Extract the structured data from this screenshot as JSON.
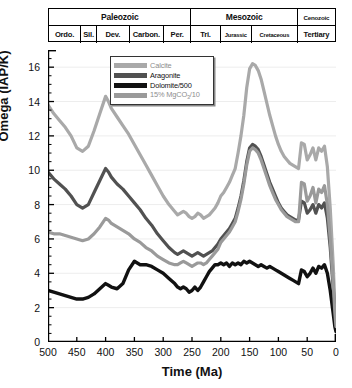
{
  "timescale": {
    "eras": [
      {
        "label": "Paleozoic",
        "from": 500,
        "to": 251,
        "small": false
      },
      {
        "label": "Mesozoic",
        "from": 251,
        "to": 65,
        "small": false
      },
      {
        "label": "Cenozoic",
        "from": 65,
        "to": 0,
        "small": true
      }
    ],
    "periods": [
      {
        "label": "Ordo.",
        "from": 500,
        "to": 444,
        "small": false
      },
      {
        "label": "Sil.",
        "from": 444,
        "to": 416,
        "small": false
      },
      {
        "label": "Dev.",
        "from": 416,
        "to": 359,
        "small": false
      },
      {
        "label": "Carbon.",
        "from": 359,
        "to": 299,
        "small": false
      },
      {
        "label": "Per.",
        "from": 299,
        "to": 251,
        "small": false
      },
      {
        "label": "Tri.",
        "from": 251,
        "to": 200,
        "small": false
      },
      {
        "label": "Jurassic",
        "from": 200,
        "to": 145,
        "small": true
      },
      {
        "label": "Cretaceous",
        "from": 145,
        "to": 65,
        "small": true
      },
      {
        "label": "Tertiary",
        "from": 65,
        "to": 0,
        "small": false
      }
    ]
  },
  "legend": {
    "items": [
      {
        "label": "Calcite",
        "color": "#a9a9a9",
        "sub": ""
      },
      {
        "label": "Aragonite",
        "color": "#515151",
        "sub": ""
      },
      {
        "label": "Dolomite/500",
        "color": "#111111",
        "sub": ""
      },
      {
        "label": "15% MgCO",
        "color": "#9a9a9a",
        "sub": "3",
        "suffix": "/10"
      }
    ]
  },
  "chart_data": {
    "type": "line",
    "title": "",
    "xlabel": "Time (Ma)",
    "ylabel": "Omega (IAP/K)",
    "xlim": [
      500,
      0
    ],
    "ylim": [
      0,
      17
    ],
    "xticks": [
      500,
      450,
      400,
      350,
      300,
      250,
      200,
      150,
      100,
      50,
      0
    ],
    "yticks": [
      0,
      2,
      4,
      6,
      8,
      10,
      12,
      14,
      16
    ],
    "x_reversed": true,
    "grid": "horizontal-faint",
    "legend_position": "top-center",
    "series": [
      {
        "name": "Calcite",
        "color": "#a9a9a9",
        "width": 3.2,
        "x": [
          500,
          490,
          480,
          470,
          460,
          450,
          440,
          430,
          420,
          410,
          400,
          395,
          390,
          380,
          370,
          360,
          350,
          340,
          330,
          320,
          310,
          300,
          290,
          280,
          275,
          270,
          265,
          260,
          255,
          250,
          245,
          240,
          235,
          230,
          225,
          220,
          215,
          210,
          205,
          200,
          195,
          190,
          185,
          180,
          175,
          170,
          165,
          160,
          155,
          150,
          145,
          140,
          135,
          130,
          125,
          120,
          115,
          110,
          105,
          100,
          95,
          90,
          85,
          80,
          75,
          70,
          65,
          60,
          55,
          50,
          45,
          40,
          35,
          30,
          25,
          20,
          15,
          10,
          5,
          2,
          0
        ],
        "y": [
          13.8,
          13.3,
          12.9,
          12.5,
          12.0,
          11.3,
          11.1,
          11.4,
          12.3,
          13.3,
          14.3,
          14.0,
          13.6,
          13.1,
          12.6,
          12.1,
          11.5,
          10.9,
          10.3,
          9.7,
          9.1,
          8.5,
          8.0,
          7.6,
          7.4,
          7.5,
          7.6,
          7.5,
          7.3,
          7.2,
          7.3,
          7.5,
          7.4,
          7.2,
          7.3,
          7.4,
          7.6,
          7.8,
          8.1,
          8.5,
          8.7,
          9.0,
          9.3,
          9.7,
          10.1,
          11.0,
          12.0,
          13.2,
          14.8,
          15.9,
          16.2,
          16.1,
          15.8,
          15.3,
          14.6,
          13.9,
          13.2,
          12.6,
          12.0,
          11.5,
          11.1,
          10.8,
          10.6,
          10.4,
          10.3,
          10.2,
          10.1,
          11.6,
          11.5,
          10.6,
          10.9,
          11.3,
          10.6,
          11.3,
          11.1,
          11.4,
          10.2,
          7.8,
          4.6,
          2.2,
          1.1
        ]
      },
      {
        "name": "Aragonite",
        "color": "#515151",
        "width": 3.2,
        "x": [
          500,
          490,
          480,
          470,
          460,
          450,
          440,
          430,
          420,
          410,
          400,
          395,
          390,
          380,
          370,
          360,
          350,
          340,
          330,
          320,
          310,
          300,
          290,
          280,
          275,
          270,
          265,
          260,
          255,
          250,
          245,
          240,
          235,
          230,
          225,
          220,
          215,
          210,
          205,
          200,
          195,
          190,
          185,
          180,
          175,
          170,
          165,
          160,
          155,
          150,
          145,
          140,
          135,
          130,
          125,
          120,
          115,
          110,
          105,
          100,
          95,
          90,
          85,
          80,
          75,
          70,
          65,
          60,
          55,
          50,
          45,
          40,
          35,
          30,
          25,
          20,
          15,
          10,
          5,
          2,
          0
        ],
        "y": [
          9.9,
          9.5,
          9.2,
          8.9,
          8.5,
          8.0,
          7.8,
          8.0,
          8.7,
          9.4,
          10.1,
          9.9,
          9.6,
          9.2,
          8.9,
          8.5,
          8.1,
          7.7,
          7.2,
          6.8,
          6.3,
          5.9,
          5.5,
          5.2,
          5.1,
          5.2,
          5.3,
          5.2,
          5.1,
          5.0,
          5.1,
          5.2,
          5.1,
          5.0,
          5.1,
          5.2,
          5.3,
          5.5,
          5.7,
          6.0,
          6.2,
          6.4,
          6.6,
          6.9,
          7.2,
          7.8,
          8.5,
          9.4,
          10.5,
          11.3,
          11.5,
          11.4,
          11.2,
          10.8,
          10.3,
          9.8,
          9.3,
          8.9,
          8.5,
          8.1,
          7.8,
          7.6,
          7.4,
          7.3,
          7.2,
          7.1,
          7.1,
          8.2,
          8.1,
          7.5,
          7.7,
          8.0,
          7.5,
          8.0,
          7.8,
          8.1,
          7.2,
          5.5,
          3.2,
          1.5,
          0.8
        ]
      },
      {
        "name": "Dolomite/500",
        "color": "#111111",
        "width": 3.4,
        "x": [
          500,
          490,
          480,
          470,
          460,
          450,
          440,
          430,
          420,
          410,
          400,
          395,
          390,
          380,
          370,
          360,
          350,
          340,
          330,
          320,
          310,
          300,
          290,
          280,
          275,
          270,
          265,
          260,
          255,
          250,
          245,
          240,
          235,
          230,
          225,
          220,
          215,
          210,
          205,
          200,
          195,
          190,
          185,
          180,
          175,
          170,
          165,
          160,
          155,
          150,
          145,
          140,
          135,
          130,
          125,
          120,
          115,
          110,
          105,
          100,
          95,
          90,
          85,
          80,
          75,
          70,
          65,
          60,
          55,
          50,
          45,
          40,
          35,
          30,
          25,
          20,
          15,
          10,
          5,
          2,
          0
        ],
        "y": [
          3.0,
          2.9,
          2.8,
          2.7,
          2.6,
          2.5,
          2.5,
          2.6,
          2.8,
          3.1,
          3.4,
          3.3,
          3.2,
          3.1,
          3.4,
          4.2,
          4.7,
          4.5,
          4.5,
          4.4,
          4.2,
          4.0,
          3.7,
          3.4,
          3.2,
          3.1,
          3.2,
          3.1,
          2.9,
          3.0,
          3.2,
          3.0,
          3.2,
          3.5,
          3.8,
          4.1,
          4.3,
          4.5,
          4.5,
          4.6,
          4.5,
          4.6,
          4.4,
          4.6,
          4.5,
          4.6,
          4.5,
          4.7,
          4.6,
          4.7,
          4.6,
          4.5,
          4.4,
          4.5,
          4.4,
          4.3,
          4.4,
          4.3,
          4.2,
          4.1,
          4.0,
          3.9,
          3.8,
          3.7,
          3.6,
          3.5,
          3.4,
          4.2,
          4.1,
          3.8,
          4.0,
          4.3,
          4.0,
          4.4,
          4.3,
          4.5,
          4.0,
          3.0,
          1.7,
          0.9,
          0.6
        ]
      },
      {
        "name": "15% MgCO3/10",
        "color": "#9a9a9a",
        "width": 3.2,
        "x": [
          500,
          490,
          480,
          470,
          460,
          450,
          440,
          430,
          420,
          410,
          400,
          395,
          390,
          380,
          370,
          360,
          350,
          340,
          330,
          320,
          310,
          300,
          290,
          280,
          275,
          270,
          265,
          260,
          255,
          250,
          245,
          240,
          235,
          230,
          225,
          220,
          215,
          210,
          205,
          200,
          195,
          190,
          185,
          180,
          175,
          170,
          165,
          160,
          155,
          150,
          145,
          140,
          135,
          130,
          125,
          120,
          115,
          110,
          105,
          100,
          95,
          90,
          85,
          80,
          75,
          70,
          65,
          60,
          55,
          50,
          45,
          40,
          35,
          30,
          25,
          20,
          15,
          10,
          5,
          2,
          0
        ],
        "y": [
          6.4,
          6.3,
          6.3,
          6.2,
          6.1,
          6.0,
          5.9,
          6.0,
          6.3,
          6.7,
          7.2,
          7.1,
          6.9,
          6.7,
          6.5,
          6.3,
          6.0,
          5.8,
          5.5,
          5.3,
          5.0,
          4.8,
          4.6,
          4.5,
          4.5,
          4.6,
          4.7,
          4.6,
          4.5,
          4.4,
          4.5,
          4.6,
          4.6,
          4.5,
          4.6,
          4.8,
          5.0,
          5.2,
          5.4,
          5.8,
          6.0,
          6.2,
          6.4,
          6.7,
          7.0,
          7.6,
          8.3,
          9.2,
          10.3,
          11.1,
          11.3,
          11.2,
          11.0,
          10.6,
          10.1,
          9.6,
          9.1,
          8.7,
          8.3,
          8.0,
          7.7,
          7.5,
          7.3,
          7.2,
          7.1,
          7.0,
          7.0,
          9.3,
          9.2,
          8.2,
          8.5,
          9.0,
          8.1,
          8.9,
          8.7,
          9.1,
          8.0,
          6.0,
          3.5,
          1.7,
          0.9
        ]
      }
    ]
  }
}
